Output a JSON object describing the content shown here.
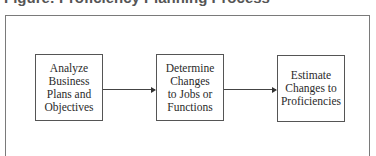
{
  "title": "Figure: Proficiency Planning Process",
  "diagram": {
    "type": "flowchart",
    "direction": "left-to-right",
    "nodes": [
      {
        "id": "n1",
        "label": "Analyze\nBusiness\nPlans and\nObjectives"
      },
      {
        "id": "n2",
        "label": "Determine\nChanges\nto Jobs or\nFunctions"
      },
      {
        "id": "n3",
        "label": "Estimate\nChanges to\nProficiencies"
      }
    ],
    "edges": [
      {
        "from": "n1",
        "to": "n2"
      },
      {
        "from": "n2",
        "to": "n3"
      }
    ]
  }
}
